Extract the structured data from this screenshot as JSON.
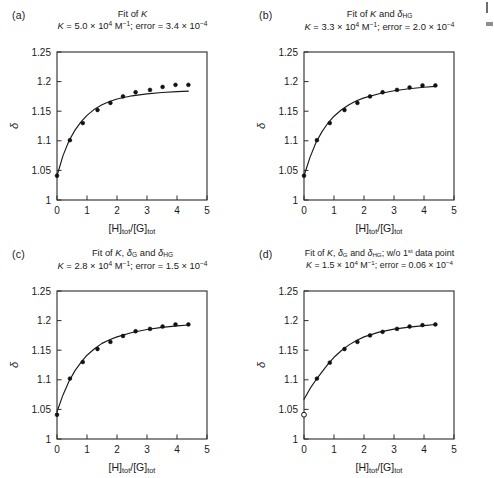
{
  "figure": {
    "axis": {
      "xlabel_parts": [
        "[H]",
        "tot",
        "/[G]",
        "tot"
      ],
      "ylabel": "δ",
      "xticks": [
        0,
        1,
        2,
        3,
        4,
        5
      ],
      "yticks": [
        "1",
        "1.05",
        "1.1",
        "1.15",
        "1.2",
        "1.25"
      ],
      "xlim": [
        0,
        5
      ],
      "ylim": [
        1,
        1.25
      ]
    },
    "panels": [
      {
        "label": "(a)",
        "title_line1": "Fit of K",
        "title_line2": "K = 5.0 × 10⁴ M⁻¹; error = 3.4 × 10⁻⁴",
        "K_value": "5.0",
        "K_exponent": "4",
        "error_value": "3.4",
        "error_exponent": "-4",
        "chart_data": {
          "type": "scatter",
          "title": "Fit of K",
          "xlabel": "[H]tot/[G]tot",
          "ylabel": "δ",
          "xlim": [
            0,
            5
          ],
          "ylim": [
            1,
            1.25
          ],
          "grid": false,
          "legend": "none",
          "series": [
            {
              "name": "observed",
              "marker": "filled-circle",
              "x": [
                0.0,
                0.43,
                0.86,
                1.35,
                1.78,
                2.2,
                2.62,
                3.1,
                3.52,
                3.95,
                4.38
              ],
              "y": [
                1.041,
                1.101,
                1.13,
                1.152,
                1.164,
                1.175,
                1.182,
                1.186,
                1.191,
                1.1945,
                1.1945
              ],
              "open_first_point": false
            },
            {
              "name": "fit",
              "marker": "line",
              "x": [
                0.0,
                0.2,
                0.4,
                0.6,
                0.8,
                1.0,
                1.25,
                1.5,
                1.75,
                2.0,
                2.5,
                3.0,
                3.5,
                4.0,
                4.38
              ],
              "y": [
                1.041,
                1.075,
                1.1,
                1.118,
                1.132,
                1.143,
                1.1535,
                1.161,
                1.1665,
                1.1705,
                1.176,
                1.1793,
                1.1815,
                1.183,
                1.184
              ]
            }
          ]
        }
      },
      {
        "label": "(b)",
        "title_line1": "Fit of K and δHG",
        "title_line2": "K = 3.3 × 10⁴ M⁻¹; error = 2.0 × 10⁻⁴",
        "K_value": "3.3",
        "K_exponent": "4",
        "error_value": "2.0",
        "error_exponent": "-4",
        "chart_data": {
          "type": "scatter",
          "title": "Fit of K and δHG",
          "xlabel": "[H]tot/[G]tot",
          "ylabel": "δ",
          "xlim": [
            0,
            5
          ],
          "ylim": [
            1,
            1.25
          ],
          "grid": false,
          "legend": "none",
          "series": [
            {
              "name": "observed",
              "marker": "filled-circle",
              "x": [
                0.0,
                0.43,
                0.86,
                1.35,
                1.78,
                2.2,
                2.62,
                3.1,
                3.52,
                3.95,
                4.38
              ],
              "y": [
                1.041,
                1.101,
                1.13,
                1.152,
                1.164,
                1.175,
                1.182,
                1.186,
                1.19,
                1.1935,
                1.1935
              ],
              "open_first_point": false
            },
            {
              "name": "fit",
              "marker": "line",
              "x": [
                0.0,
                0.2,
                0.4,
                0.6,
                0.8,
                1.0,
                1.25,
                1.5,
                1.75,
                2.0,
                2.5,
                3.0,
                3.5,
                4.0,
                4.38
              ],
              "y": [
                1.041,
                1.072,
                1.097,
                1.1155,
                1.13,
                1.1415,
                1.1525,
                1.161,
                1.1675,
                1.1725,
                1.1795,
                1.1845,
                1.188,
                1.1905,
                1.192
              ]
            }
          ]
        }
      },
      {
        "label": "(c)",
        "title_line1": "Fit of K, δG and δHG",
        "title_line2": "K = 2.8 × 10⁴ M⁻¹; error = 1.5 × 10⁻⁴",
        "K_value": "2.8",
        "K_exponent": "4",
        "error_value": "1.5",
        "error_exponent": "-4",
        "chart_data": {
          "type": "scatter",
          "title": "Fit of K, δG and δHG",
          "xlabel": "[H]tot/[G]tot",
          "ylabel": "δ",
          "xlim": [
            0,
            5
          ],
          "ylim": [
            1,
            1.25
          ],
          "grid": false,
          "legend": "none",
          "series": [
            {
              "name": "observed",
              "marker": "filled-circle",
              "x": [
                0.0,
                0.43,
                0.86,
                1.35,
                1.78,
                2.2,
                2.62,
                3.1,
                3.52,
                3.95,
                4.38
              ],
              "y": [
                1.041,
                1.102,
                1.13,
                1.152,
                1.164,
                1.174,
                1.182,
                1.186,
                1.19,
                1.1935,
                1.1935
              ],
              "open_first_point": false
            },
            {
              "name": "fit",
              "marker": "line",
              "x": [
                0.0,
                0.2,
                0.4,
                0.6,
                0.8,
                1.0,
                1.25,
                1.5,
                1.75,
                2.0,
                2.5,
                3.0,
                3.5,
                4.0,
                4.38
              ],
              "y": [
                1.046,
                1.0745,
                1.0975,
                1.1155,
                1.1295,
                1.1415,
                1.1525,
                1.1615,
                1.1675,
                1.1725,
                1.18,
                1.185,
                1.1885,
                1.191,
                1.1925
              ]
            }
          ]
        }
      },
      {
        "label": "(d)",
        "title_line1": "Fit of K, δG and δHG; w/o 1st data point",
        "title_line2": "K = 1.5 × 10⁴ M⁻¹; error = 0.06 × 10⁻⁴",
        "K_value": "1.5",
        "K_exponent": "4",
        "error_value": "0.06",
        "error_exponent": "-4",
        "chart_data": {
          "type": "scatter",
          "title": "Fit of K, δG and δHG; w/o 1st data point",
          "xlabel": "[H]tot/[G]tot",
          "ylabel": "δ",
          "xlim": [
            0,
            5
          ],
          "ylim": [
            1,
            1.25
          ],
          "grid": false,
          "legend": "none",
          "series": [
            {
              "name": "observed",
              "marker": "filled-circle",
              "x": [
                0.0,
                0.43,
                0.86,
                1.35,
                1.78,
                2.2,
                2.62,
                3.1,
                3.52,
                3.95,
                4.38
              ],
              "y": [
                1.041,
                1.102,
                1.129,
                1.152,
                1.164,
                1.175,
                1.181,
                1.186,
                1.19,
                1.1925,
                1.1935
              ],
              "open_first_point": true
            },
            {
              "name": "fit",
              "marker": "line",
              "x": [
                0.0,
                0.2,
                0.4,
                0.6,
                0.8,
                1.0,
                1.25,
                1.5,
                1.75,
                2.0,
                2.5,
                3.0,
                3.5,
                4.0,
                4.38
              ],
              "y": [
                1.067,
                1.085,
                1.1,
                1.1135,
                1.1265,
                1.138,
                1.1495,
                1.159,
                1.1665,
                1.1725,
                1.1805,
                1.1855,
                1.189,
                1.1915,
                1.1935
              ]
            }
          ]
        }
      }
    ]
  }
}
